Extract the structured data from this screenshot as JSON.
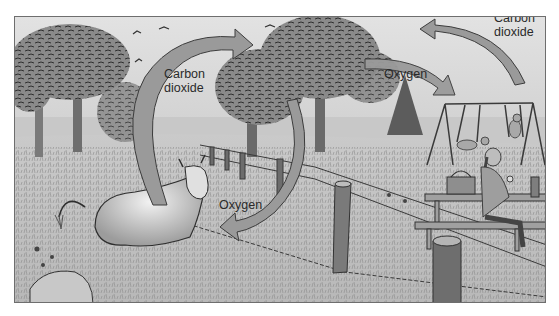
{
  "figure": {
    "type": "illustration",
    "style": "grayscale pencil sketch",
    "colors": {
      "frame_border": "#6e6e6e",
      "sky": "#dcdcdc",
      "ground": "#c4c4c4",
      "arrow_fill": "#9a9a9a",
      "arrow_stroke": "#3c3c3c",
      "text": "#2a2a2a"
    }
  },
  "labels": {
    "cow_co2": {
      "line1": "Carbon",
      "line2": "dioxide"
    },
    "tree_o2_to_cow": "Oxygen",
    "tree_o2_to_person": "Oxygen",
    "person_co2": {
      "line1": "Carbon",
      "line2": "dioxide"
    }
  },
  "arrows": [
    {
      "name": "cow-to-trees",
      "label": "Carbon dioxide",
      "from": "cow",
      "to": "trees"
    },
    {
      "name": "trees-to-cow",
      "label": "Oxygen",
      "from": "trees",
      "to": "cow"
    },
    {
      "name": "trees-to-person",
      "label": "Oxygen",
      "from": "trees",
      "to": "person"
    },
    {
      "name": "person-to-trees",
      "label": "Carbon dioxide",
      "from": "person",
      "to": "trees"
    }
  ],
  "scene_elements": [
    "trees",
    "birds",
    "cow",
    "fence",
    "fence-posts",
    "swing-set",
    "children-on-swings",
    "picnic-table",
    "picnic-basket",
    "seated-girl",
    "thermos",
    "tree-stump",
    "rock",
    "wildflowers",
    "pine-tree"
  ]
}
